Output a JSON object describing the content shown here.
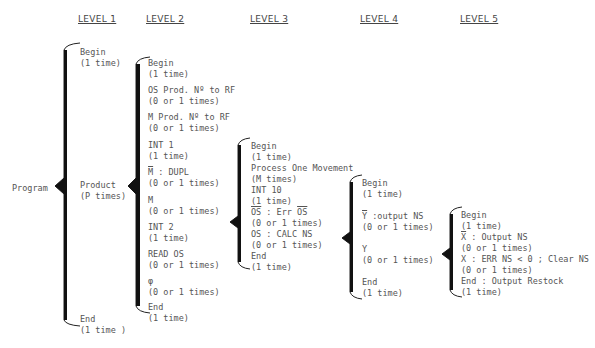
{
  "levels": [
    "LEVEL 1",
    "LEVEL 2",
    "LEVEL 3",
    "LEVEL 4",
    "LEVEL 5"
  ],
  "root": "Program",
  "level1": [
    {
      "name": "Begin",
      "count": "(1 time)"
    },
    {
      "name": "Product",
      "count": "(P times)"
    },
    {
      "name": "End",
      "count": "(1 time )"
    }
  ],
  "level2": [
    {
      "name": "Begin",
      "count": "(1 time)"
    },
    {
      "name": "OS Prod. Nº to RF",
      "count": "(0 or 1 times)"
    },
    {
      "name": "M Prod. Nº to RF",
      "count": "(0 or 1 times)"
    },
    {
      "name": "INT 1",
      "count": "(1 time)"
    },
    {
      "name_bar": "M",
      "name_rest": " : DUPL",
      "count": "(0 or 1 times)"
    },
    {
      "name": "M",
      "count": "(0 or 1 times)"
    },
    {
      "name": "INT 2",
      "count": "(1 time)"
    },
    {
      "name": "READ OS",
      "count": "(0 or 1 times)"
    },
    {
      "name": "φ",
      "count": "(0 or 1 times)"
    },
    {
      "name": "End",
      "count": "(1 time)"
    }
  ],
  "level3": [
    {
      "name": "Begin",
      "count": "(1 time)"
    },
    {
      "name": "Process One Movement",
      "count": "(M times)"
    },
    {
      "name": "INT 10",
      "count": "(1 time)"
    },
    {
      "name_bar": "OS",
      "name_mid": " : Err ",
      "name_bar2": "OS",
      "count": "(0 or 1 times)"
    },
    {
      "name": "OS : CALC NS",
      "count": "(0 or 1 times)"
    },
    {
      "name": "End",
      "count": "(1 time)"
    }
  ],
  "level4": [
    {
      "name": "Begin",
      "count": "(1 time)"
    },
    {
      "name_bar": "Y",
      "name_rest": " :output NS",
      "count": "(0 or 1 times)"
    },
    {
      "name": "Y",
      "count": "(0 or 1 times)"
    },
    {
      "name": "End",
      "count": "(1 time)"
    }
  ],
  "level5": [
    {
      "name": "Begin",
      "count": "(1 time)"
    },
    {
      "name_bar": "X",
      "name_rest": " : Output NS",
      "count": "(0 or 1 times)"
    },
    {
      "name": "X : ERR NS < 0 ; Clear NS",
      "count": "(0 or 1 times)"
    },
    {
      "name": "End : Output Restock",
      "count": "(1 time)"
    }
  ]
}
